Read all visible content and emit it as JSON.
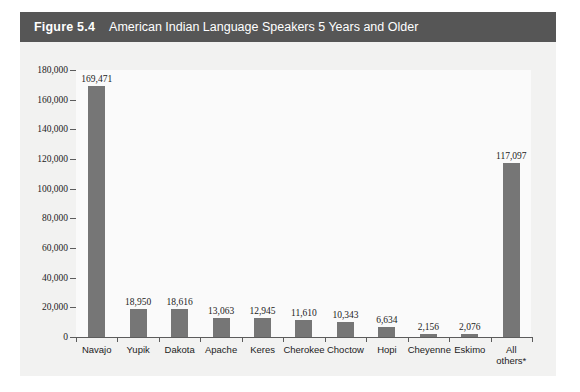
{
  "figure": {
    "number": "Figure 5.4",
    "caption": "American Indian Language Speakers 5 Years and Older",
    "title_bar_color": "#565656",
    "panel_color": "#f2f2f1",
    "bar_color": "#767676"
  },
  "chart_data": {
    "type": "bar",
    "title": "American Indian Language Speakers 5 Years and Older",
    "xlabel": "",
    "ylabel": "",
    "ylim": [
      0,
      180000
    ],
    "ytick_values": [
      0,
      20000,
      40000,
      60000,
      80000,
      100000,
      120000,
      140000,
      160000,
      180000
    ],
    "ytick_labels": [
      "0",
      "20,000",
      "40,000",
      "60,000",
      "80,000",
      "100,000",
      "120,000",
      "140,000",
      "160,000",
      "180,000"
    ],
    "grid": false,
    "legend": null,
    "categories": [
      "Navajo",
      "Yupik",
      "Dakota",
      "Apache",
      "Keres",
      "Cherokee",
      "Choctow",
      "Hopi",
      "Cheyenne",
      "Eskimo",
      "All\nothers*"
    ],
    "values": [
      169471,
      18950,
      18616,
      13063,
      12945,
      11610,
      10343,
      6634,
      2156,
      2076,
      117097
    ],
    "data_labels": [
      "169,471",
      "18,950",
      "18,616",
      "13,063",
      "12,945",
      "11,610",
      "10,343",
      "6,634",
      "2,156",
      "2,076",
      "117,097"
    ]
  }
}
